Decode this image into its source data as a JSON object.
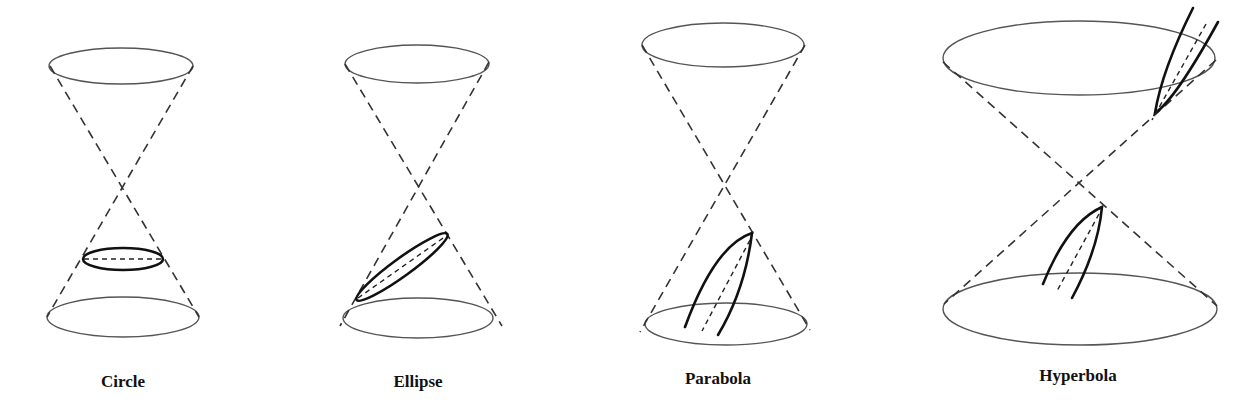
{
  "figure": {
    "panels": [
      {
        "id": "circle",
        "label": "Circle",
        "label_pos": [
          123,
          372
        ],
        "top_ellipse": {
          "cx": 121,
          "cy": 66,
          "rx": 72,
          "ry": 18
        },
        "bottom_ellipse": {
          "cx": 123,
          "cy": 317,
          "rx": 76,
          "ry": 20
        },
        "apex": [
          122,
          187
        ],
        "section_type": "horizontal-ellipse",
        "section": {
          "cx": 123,
          "cy": 259,
          "rx": 40,
          "ry": 11
        }
      },
      {
        "id": "ellipse",
        "label": "Ellipse",
        "label_pos": [
          418,
          372
        ],
        "top_ellipse": {
          "cx": 417,
          "cy": 64,
          "rx": 72,
          "ry": 19
        },
        "bottom_ellipse": {
          "cx": 418,
          "cy": 318,
          "rx": 75,
          "ry": 20
        },
        "apex": [
          415,
          187
        ],
        "section_type": "tilted-ellipse",
        "section": {
          "cx": 402,
          "cy": 267,
          "rx": 56,
          "ry": 9,
          "angle": -36
        }
      },
      {
        "id": "parabola",
        "label": "Parabola",
        "label_pos": [
          718,
          369
        ],
        "top_ellipse": {
          "cx": 723,
          "cy": 45,
          "rx": 81,
          "ry": 22
        },
        "bottom_ellipse": {
          "cx": 726,
          "cy": 324,
          "rx": 81,
          "ry": 21
        },
        "apex": [
          725,
          185
        ],
        "section_type": "parabola",
        "vertex": [
          752,
          233
        ],
        "left_end": [
          685,
          327
        ],
        "right_end": [
          718,
          335
        ],
        "axis_end": [
          702,
          331
        ]
      },
      {
        "id": "hyperbola",
        "label": "Hyperbola",
        "label_pos": [
          1078,
          366
        ],
        "top_ellipse": {
          "cx": 1079,
          "cy": 58,
          "rx": 136,
          "ry": 37
        },
        "bottom_ellipse": {
          "cx": 1080,
          "cy": 309,
          "rx": 137,
          "ry": 36
        },
        "apex": [
          1078,
          183
        ],
        "section_type": "hyperbola",
        "lower_branch": {
          "vertex": [
            1102,
            207
          ],
          "left_end": [
            1043,
            284
          ],
          "right_end": [
            1072,
            298
          ],
          "axis_end": [
            1057,
            291
          ]
        },
        "upper_branch": {
          "vertex": [
            1155,
            113
          ],
          "left_end": [
            1193,
            8
          ],
          "right_end": [
            1218,
            22
          ],
          "axis_end": [
            1206,
            24
          ]
        }
      }
    ]
  },
  "labels": {
    "circle": "Circle",
    "ellipse": "Ellipse",
    "parabola": "Parabola",
    "hyperbola": "Hyperbola"
  },
  "colors": {
    "background": "#ffffff",
    "outline": "#555555",
    "section": "#111111"
  }
}
